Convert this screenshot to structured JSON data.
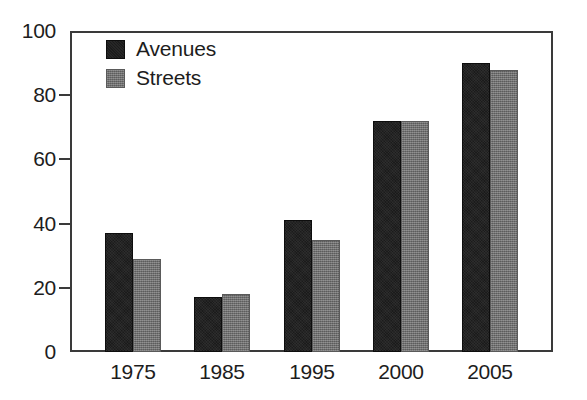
{
  "chart_data": {
    "type": "bar",
    "title": "",
    "subtitle": "",
    "xlabel": "",
    "ylabel": "",
    "categories": [
      "1975",
      "1985",
      "1995",
      "2000",
      "2005"
    ],
    "series": [
      {
        "name": "Avenues",
        "color": "#1b1b1b",
        "values": [
          37,
          17,
          41,
          72,
          90
        ]
      },
      {
        "name": "Streets",
        "color": "#6d6d6d",
        "values": [
          29,
          18,
          35,
          72,
          88
        ]
      }
    ],
    "ylim": [
      0,
      100
    ],
    "ytick_labels": [
      "0",
      "20",
      "40",
      "60",
      "80",
      "100"
    ],
    "ytick_values": [
      0,
      20,
      40,
      60,
      80,
      100
    ],
    "grid": false,
    "legend_position": "top-left",
    "bar_group_mode": "grouped",
    "annotations": []
  },
  "legend": {
    "entries": [
      {
        "label": "Avenues",
        "swatch": "legend-swatch-avenues"
      },
      {
        "label": "Streets",
        "swatch": "legend-swatch-streets"
      }
    ]
  },
  "axes": {
    "y": {
      "ticks": [
        {
          "label": "100",
          "value": 100
        },
        {
          "label": "80",
          "value": 80
        },
        {
          "label": "60",
          "value": 60
        },
        {
          "label": "40",
          "value": 40
        },
        {
          "label": "20",
          "value": 20
        },
        {
          "label": "0",
          "value": 0
        }
      ]
    },
    "x": {
      "ticks": [
        {
          "label": "1975"
        },
        {
          "label": "1985"
        },
        {
          "label": "1995"
        },
        {
          "label": "2000"
        },
        {
          "label": "2005"
        }
      ]
    }
  },
  "colors": {
    "axis": "#3a3a3a",
    "text": "#1d1d1d",
    "background": "#ffffff",
    "series_avenues": "#1b1b1b",
    "series_streets": "#6d6d6d"
  }
}
